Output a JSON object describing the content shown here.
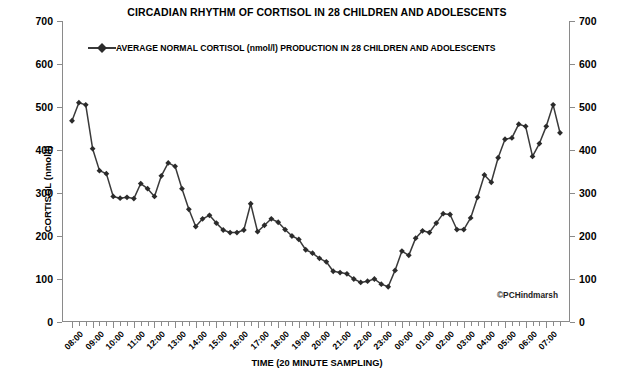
{
  "chart_data": {
    "type": "line",
    "title": "CIRCADIAN RHYTHM OF CORTISOL IN 28 CHILDREN AND ADOLESCENTS",
    "xlabel": "TIME (20 MINUTE SAMPLING)",
    "ylabel": "CORTISOL (nmol/l)",
    "ylim": [
      0,
      700
    ],
    "yticks": [
      0,
      100,
      200,
      300,
      400,
      500,
      600,
      700
    ],
    "ytick_labels_left": [
      "0",
      "100",
      "200",
      "300",
      "400",
      "500",
      "600",
      "700"
    ],
    "ytick_labels_right": [
      "0",
      "100",
      "200",
      "300",
      "400",
      "500",
      "600",
      "700"
    ],
    "right_axis": true,
    "grid": false,
    "legend_position": "top-inside",
    "legend": [
      {
        "name": "AVERAGE  NORMAL CORTISOL (nmol/l) PRODUCTION IN 28 CHILDREN AND ADOLESCENTS",
        "color": "#3a3a3a",
        "marker": "diamond"
      }
    ],
    "annotations": [
      {
        "text": "©PCHindmarsh",
        "position": "bottom-right"
      }
    ],
    "x_tick_labels": [
      "08:00",
      "09:00",
      "10:00",
      "11:00",
      "12:00",
      "13:00",
      "14:00",
      "15:00",
      "16:00",
      "17:00",
      "18:00",
      "19:00",
      "20:00",
      "21:00",
      "22:00",
      "23:00",
      "00:00",
      "01:00",
      "02:00",
      "03:00",
      "04:00",
      "05:00",
      "06:00",
      "07:00"
    ],
    "x_sampling_minutes": 20,
    "x": [
      "08:00",
      "08:20",
      "08:40",
      "09:00",
      "09:20",
      "09:40",
      "10:00",
      "10:20",
      "10:40",
      "11:00",
      "11:20",
      "11:40",
      "12:00",
      "12:20",
      "12:40",
      "13:00",
      "13:20",
      "13:40",
      "14:00",
      "14:20",
      "14:40",
      "15:00",
      "15:20",
      "15:40",
      "16:00",
      "16:20",
      "16:40",
      "17:00",
      "17:20",
      "17:40",
      "18:00",
      "18:20",
      "18:40",
      "19:00",
      "19:20",
      "19:40",
      "20:00",
      "20:20",
      "20:40",
      "21:00",
      "21:20",
      "21:40",
      "22:00",
      "22:20",
      "22:40",
      "23:00",
      "23:20",
      "23:40",
      "00:00",
      "00:20",
      "00:40",
      "01:00",
      "01:20",
      "01:40",
      "02:00",
      "02:20",
      "02:40",
      "03:00",
      "03:20",
      "03:40",
      "04:00",
      "04:20",
      "04:40",
      "05:00",
      "05:20",
      "05:40",
      "06:00",
      "06:20",
      "06:40",
      "07:00",
      "07:20",
      "07:40"
    ],
    "series": [
      {
        "name": "AVERAGE  NORMAL CORTISOL (nmol/l) PRODUCTION IN 28 CHILDREN AND ADOLESCENTS",
        "color": "#3a3a3a",
        "values": [
          468,
          510,
          505,
          403,
          352,
          345,
          292,
          288,
          290,
          287,
          322,
          310,
          292,
          340,
          370,
          362,
          310,
          262,
          222,
          240,
          248,
          230,
          214,
          208,
          208,
          214,
          275,
          210,
          225,
          240,
          232,
          215,
          200,
          192,
          168,
          160,
          148,
          140,
          118,
          115,
          112,
          100,
          92,
          95,
          100,
          88,
          82,
          120,
          165,
          155,
          195,
          212,
          208,
          230,
          252,
          250,
          215,
          215,
          242,
          290,
          342,
          325,
          382,
          425,
          428,
          460,
          455,
          385,
          415,
          455,
          505,
          440
        ]
      }
    ]
  }
}
